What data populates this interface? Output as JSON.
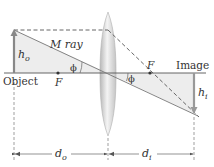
{
  "diagram": {
    "labels": {
      "object": "Object",
      "image": "Image",
      "m_ray": "M ray",
      "focal_left": "F",
      "focal_right": "F",
      "angle_left": "ϕ",
      "angle_right": "ϕ",
      "object_height_main": "h",
      "object_height_sub": "o",
      "image_height_main": "h",
      "image_height_sub": "i",
      "object_distance_main": "d",
      "object_distance_sub": "o",
      "image_distance_main": "d",
      "image_distance_sub": "i"
    },
    "colors": {
      "axis": "#555555",
      "ray": "#777777",
      "dashed_ray": "#555555",
      "arrow": "#888888",
      "shade": "#ececec",
      "lens_edge": "#b5b5b5",
      "lens_center": "#f2f2f2",
      "dimension": "#666666",
      "focal_point": "#333333"
    },
    "geometry": {
      "axis_y": 73,
      "object_x": 14,
      "object_top_y": 30,
      "lens_x": 108,
      "image_x": 194,
      "image_bottom_y": 114,
      "focal_left_x": 58,
      "focal_right_x": 150,
      "dimension_y": 154
    }
  }
}
